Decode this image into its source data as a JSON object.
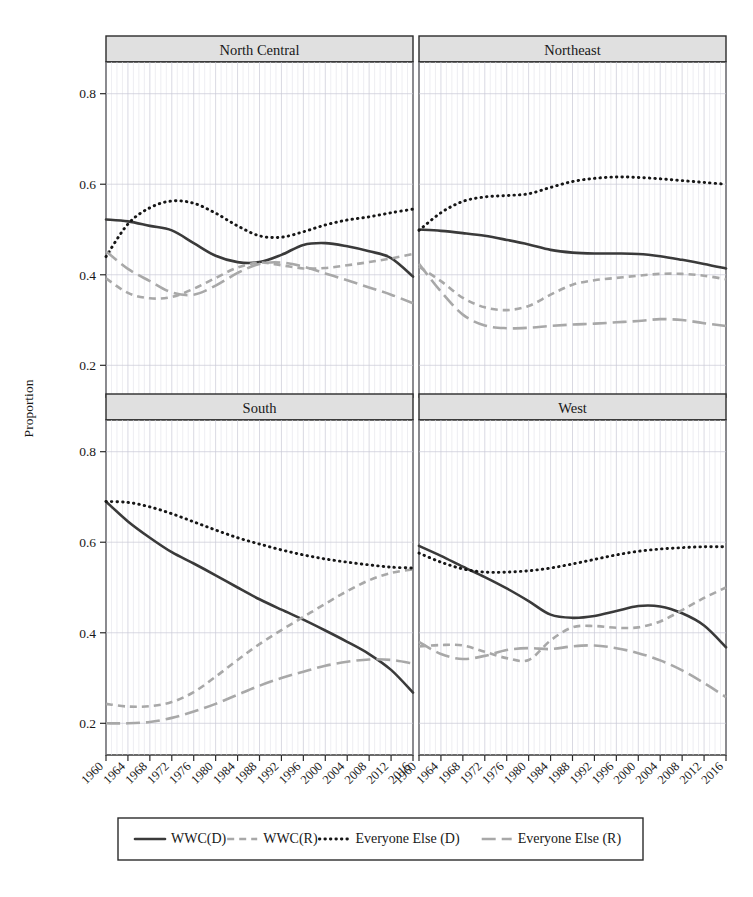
{
  "figure": {
    "ylabel": "Proportion",
    "panels": [
      "North Central",
      "Northeast",
      "South",
      "West"
    ]
  },
  "legend": {
    "items": [
      {
        "label": "WWC(D)",
        "style": "solid",
        "color": "#3a3a3a"
      },
      {
        "label": "WWC(R)",
        "style": "dashed",
        "color": "#a8a8a8"
      },
      {
        "label": "Everyone Else (D)",
        "style": "dotted",
        "color": "#161616"
      },
      {
        "label": "Everyone Else (R)",
        "style": "dashdot",
        "color": "#a8a8a8"
      }
    ]
  },
  "chart_data": {
    "type": "line",
    "title": "",
    "xlabel": "",
    "ylabel": "Proportion",
    "xlim": [
      1960,
      2016
    ],
    "ylim": [
      0.13,
      0.87
    ],
    "yticks": [
      0.2,
      0.4,
      0.6,
      0.8
    ],
    "ytick_labels": [
      "0.2",
      "0.4",
      "0.6",
      "0.8"
    ],
    "x": [
      1960,
      1964,
      1968,
      1972,
      1976,
      1980,
      1984,
      1988,
      1992,
      1996,
      2000,
      2004,
      2008,
      2012,
      2016
    ],
    "xtick_labels": [
      "1960",
      "1964",
      "1968",
      "1972",
      "1976",
      "1980",
      "1984",
      "1988",
      "1992",
      "1996",
      "2000",
      "2004",
      "2008",
      "2012",
      "2016"
    ],
    "grid": true,
    "legend_position": "bottom",
    "facets": [
      {
        "name": "North Central",
        "series": [
          {
            "name": "WWC(D)",
            "values": [
              0.522,
              0.518,
              0.508,
              0.498,
              0.47,
              0.442,
              0.428,
              0.428,
              0.444,
              0.466,
              0.47,
              0.463,
              0.452,
              0.437,
              0.396
            ]
          },
          {
            "name": "WWC(R)",
            "values": [
              0.392,
              0.36,
              0.348,
              0.351,
              0.369,
              0.393,
              0.416,
              0.427,
              0.421,
              0.414,
              0.415,
              0.421,
              0.428,
              0.436,
              0.446
            ]
          },
          {
            "name": "Everyone Else (D)",
            "values": [
              0.44,
              0.512,
              0.548,
              0.563,
              0.558,
              0.536,
              0.508,
              0.486,
              0.483,
              0.495,
              0.51,
              0.521,
              0.528,
              0.537,
              0.545
            ]
          },
          {
            "name": "Everyone Else (R)",
            "values": [
              0.452,
              0.413,
              0.386,
              0.361,
              0.356,
              0.376,
              0.404,
              0.424,
              0.427,
              0.418,
              0.403,
              0.388,
              0.372,
              0.356,
              0.337
            ]
          }
        ]
      },
      {
        "name": "Northeast",
        "series": [
          {
            "name": "WWC(D)",
            "values": [
              0.5,
              0.497,
              0.492,
              0.486,
              0.477,
              0.467,
              0.455,
              0.449,
              0.447,
              0.447,
              0.446,
              0.441,
              0.433,
              0.424,
              0.414
            ]
          },
          {
            "name": "WWC(R)",
            "values": [
              0.418,
              0.386,
              0.349,
              0.328,
              0.322,
              0.331,
              0.356,
              0.378,
              0.388,
              0.393,
              0.398,
              0.402,
              0.402,
              0.398,
              0.39
            ]
          },
          {
            "name": "Everyone Else (D)",
            "values": [
              0.498,
              0.537,
              0.562,
              0.572,
              0.575,
              0.579,
              0.593,
              0.606,
              0.613,
              0.616,
              0.615,
              0.612,
              0.608,
              0.604,
              0.6
            ]
          },
          {
            "name": "Everyone Else (R)",
            "values": [
              0.424,
              0.363,
              0.312,
              0.288,
              0.282,
              0.283,
              0.287,
              0.29,
              0.292,
              0.295,
              0.298,
              0.302,
              0.3,
              0.293,
              0.287
            ]
          }
        ]
      },
      {
        "name": "South",
        "series": [
          {
            "name": "WWC(D)",
            "values": [
              0.69,
              0.646,
              0.61,
              0.578,
              0.553,
              0.527,
              0.5,
              0.474,
              0.451,
              0.429,
              0.405,
              0.38,
              0.353,
              0.318,
              0.268
            ]
          },
          {
            "name": "WWC(R)",
            "values": [
              0.243,
              0.237,
              0.238,
              0.247,
              0.269,
              0.303,
              0.34,
              0.375,
              0.406,
              0.435,
              0.464,
              0.492,
              0.516,
              0.532,
              0.54
            ]
          },
          {
            "name": "Everyone Else (D)",
            "values": [
              0.69,
              0.688,
              0.678,
              0.663,
              0.645,
              0.627,
              0.61,
              0.596,
              0.583,
              0.572,
              0.563,
              0.556,
              0.55,
              0.545,
              0.543
            ]
          },
          {
            "name": "Everyone Else (R)",
            "values": [
              0.2,
              0.2,
              0.203,
              0.212,
              0.226,
              0.243,
              0.263,
              0.283,
              0.3,
              0.314,
              0.327,
              0.336,
              0.341,
              0.34,
              0.332
            ]
          }
        ]
      },
      {
        "name": "West",
        "series": [
          {
            "name": "WWC(D)",
            "values": [
              0.592,
              0.57,
              0.546,
              0.523,
              0.498,
              0.47,
              0.44,
              0.433,
              0.437,
              0.448,
              0.459,
              0.458,
              0.443,
              0.416,
              0.368
            ]
          },
          {
            "name": "WWC(R)",
            "values": [
              0.37,
              0.373,
              0.372,
              0.358,
              0.344,
              0.34,
              0.383,
              0.412,
              0.415,
              0.411,
              0.412,
              0.425,
              0.45,
              0.477,
              0.5
            ]
          },
          {
            "name": "Everyone Else (D)",
            "values": [
              0.576,
              0.556,
              0.541,
              0.534,
              0.534,
              0.537,
              0.543,
              0.552,
              0.562,
              0.572,
              0.58,
              0.585,
              0.588,
              0.59,
              0.59
            ]
          },
          {
            "name": "Everyone Else (R)",
            "values": [
              0.38,
              0.353,
              0.342,
              0.349,
              0.362,
              0.366,
              0.364,
              0.37,
              0.372,
              0.366,
              0.355,
              0.339,
              0.317,
              0.289,
              0.258
            ]
          }
        ]
      }
    ]
  }
}
